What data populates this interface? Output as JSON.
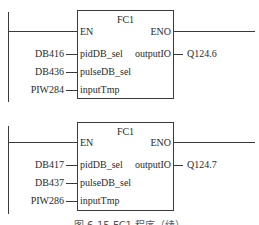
{
  "blocks": [
    {
      "title": "FC1",
      "en": "EN",
      "eno": "ENO",
      "inputs": [
        {
          "param": "pidDB_sel",
          "value": "DB416"
        },
        {
          "param": "pulseDB_sel",
          "value": "DB436"
        },
        {
          "param": "inputTmp",
          "value": "PIW284"
        }
      ],
      "output": {
        "param": "outputIO",
        "value": "Q124.6"
      }
    },
    {
      "title": "FC1",
      "en": "EN",
      "eno": "ENO",
      "inputs": [
        {
          "param": "pidDB_sel",
          "value": "DB417"
        },
        {
          "param": "pulseDB_sel",
          "value": "DB437"
        },
        {
          "param": "inputTmp",
          "value": "PIW286"
        }
      ],
      "output": {
        "param": "outputIO",
        "value": "Q124.7"
      }
    }
  ],
  "caption": "图 6-15  FC1 程序（续）"
}
